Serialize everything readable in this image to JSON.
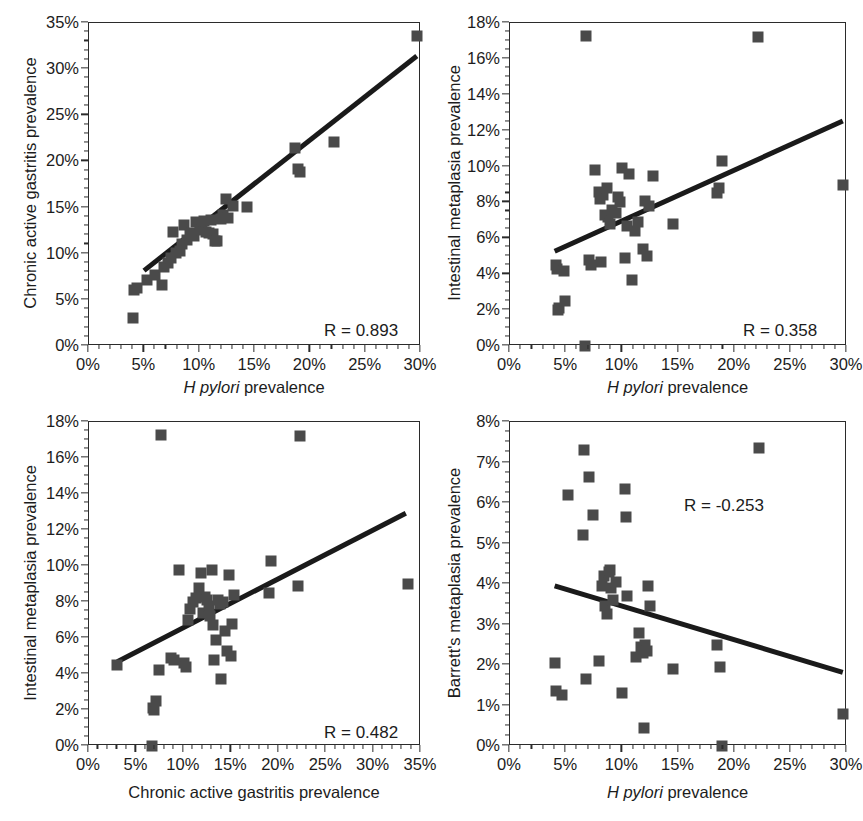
{
  "figure": {
    "panel_count": 4,
    "marker_color": "#4a4a4a",
    "line_color": "#1a1a1a",
    "axis_color": "#2b2b2b",
    "background": "#ffffff",
    "bottom_caption_fragment": ""
  },
  "chart_data": [
    {
      "id": "panel-a",
      "type": "scatter",
      "title": "",
      "xlabel_italic": "H pylori",
      "xlabel_rest": " prevalence",
      "ylabel": "Chronic active gastritis prevalence",
      "annotation": "R = 0.893",
      "r_value": 0.893,
      "xlim": [
        0,
        30
      ],
      "ylim": [
        0,
        35
      ],
      "xticks": [
        0,
        5,
        10,
        15,
        20,
        25,
        30
      ],
      "xticklabels": [
        "0%",
        "5%",
        "10%",
        "15%",
        "20%",
        "25%",
        "30%"
      ],
      "yticks": [
        0,
        5,
        10,
        15,
        20,
        25,
        30,
        35
      ],
      "yticklabels": [
        "0%",
        "5%",
        "10%",
        "15%",
        "20%",
        "25%",
        "30%",
        "35%"
      ],
      "x_minor_step": 1,
      "y_minor_step": 1,
      "grid": false,
      "points": [
        [
          4.0,
          3.0
        ],
        [
          4.1,
          6.1
        ],
        [
          4.3,
          6.3
        ],
        [
          5.2,
          7.1
        ],
        [
          6.0,
          7.7
        ],
        [
          6.6,
          6.6
        ],
        [
          6.8,
          8.6
        ],
        [
          7.1,
          9.0
        ],
        [
          7.4,
          9.5
        ],
        [
          7.6,
          12.4
        ],
        [
          7.9,
          10.1
        ],
        [
          8.2,
          10.3
        ],
        [
          8.4,
          11.0
        ],
        [
          8.6,
          13.1
        ],
        [
          8.9,
          11.5
        ],
        [
          9.1,
          12.0
        ],
        [
          9.3,
          12.2
        ],
        [
          9.5,
          11.9
        ],
        [
          9.7,
          13.4
        ],
        [
          10.0,
          13.2
        ],
        [
          10.2,
          12.6
        ],
        [
          10.4,
          13.5
        ],
        [
          10.6,
          12.4
        ],
        [
          10.8,
          12.2
        ],
        [
          11.0,
          13.6
        ],
        [
          11.2,
          12.1
        ],
        [
          11.4,
          11.4
        ],
        [
          11.6,
          11.4
        ],
        [
          11.9,
          13.8
        ],
        [
          12.1,
          14.2
        ],
        [
          12.4,
          15.9
        ],
        [
          12.6,
          13.9
        ],
        [
          13.0,
          15.2
        ],
        [
          14.3,
          15.1
        ],
        [
          18.6,
          21.5
        ],
        [
          18.9,
          19.2
        ],
        [
          19.1,
          18.9
        ],
        [
          22.1,
          22.1
        ],
        [
          29.6,
          33.6
        ]
      ],
      "fit_line": {
        "x1": 5.0,
        "y1": 8.0,
        "x2": 29.8,
        "y2": 31.4
      }
    },
    {
      "id": "panel-b",
      "type": "scatter",
      "title": "",
      "xlabel_italic": "H pylori",
      "xlabel_rest": " prevalence",
      "ylabel": "Intestinal metaplasia prevalence",
      "annotation": "R = 0.358",
      "r_value": 0.358,
      "xlim": [
        0,
        30
      ],
      "ylim": [
        0,
        18
      ],
      "xticks": [
        0,
        5,
        10,
        15,
        20,
        25,
        30
      ],
      "xticklabels": [
        "0%",
        "5%",
        "10%",
        "15%",
        "20%",
        "25%",
        "30%"
      ],
      "yticks": [
        0,
        2,
        4,
        6,
        8,
        10,
        12,
        14,
        16,
        18
      ],
      "yticklabels": [
        "0%",
        "2%",
        "4%",
        "6%",
        "8%",
        "10%",
        "12%",
        "14%",
        "16%",
        "18%"
      ],
      "x_minor_step": 1,
      "y_minor_step": 0.5,
      "grid": false,
      "points": [
        [
          4.1,
          4.5
        ],
        [
          4.2,
          4.3
        ],
        [
          4.3,
          2.0
        ],
        [
          4.4,
          2.1
        ],
        [
          4.8,
          4.2
        ],
        [
          4.9,
          2.5
        ],
        [
          6.7,
          0.0
        ],
        [
          6.8,
          17.3
        ],
        [
          7.0,
          4.8
        ],
        [
          7.2,
          4.5
        ],
        [
          7.6,
          9.8
        ],
        [
          7.9,
          8.6
        ],
        [
          8.0,
          8.2
        ],
        [
          8.1,
          4.7
        ],
        [
          8.3,
          8.4
        ],
        [
          8.5,
          7.3
        ],
        [
          8.6,
          8.8
        ],
        [
          8.7,
          7.2
        ],
        [
          8.9,
          6.8
        ],
        [
          9.1,
          7.6
        ],
        [
          9.4,
          7.4
        ],
        [
          9.6,
          8.3
        ],
        [
          9.8,
          8.0
        ],
        [
          10.0,
          9.9
        ],
        [
          10.2,
          4.9
        ],
        [
          10.4,
          6.7
        ],
        [
          10.6,
          9.6
        ],
        [
          10.9,
          3.7
        ],
        [
          11.1,
          6.4
        ],
        [
          11.4,
          6.9
        ],
        [
          11.8,
          5.4
        ],
        [
          12.0,
          8.1
        ],
        [
          12.2,
          5.0
        ],
        [
          12.4,
          7.8
        ],
        [
          12.7,
          9.5
        ],
        [
          14.5,
          6.8
        ],
        [
          18.4,
          8.5
        ],
        [
          18.6,
          8.8
        ],
        [
          18.9,
          10.3
        ],
        [
          22.1,
          17.2
        ],
        [
          29.6,
          9.0
        ]
      ],
      "fit_line": {
        "x1": 4.0,
        "y1": 5.2,
        "x2": 29.8,
        "y2": 12.5
      }
    },
    {
      "id": "panel-c",
      "type": "scatter",
      "title": "",
      "xlabel_italic": "",
      "xlabel_rest": "Chronic active gastritis prevalence",
      "ylabel": "Intestinal metaplasia prevalence",
      "annotation": "R = 0.482",
      "r_value": 0.482,
      "xlim": [
        0,
        35
      ],
      "ylim": [
        0,
        18
      ],
      "xticks": [
        0,
        5,
        10,
        15,
        20,
        25,
        30,
        35
      ],
      "xticklabels": [
        "0%",
        "5%",
        "10%",
        "15%",
        "20%",
        "25%",
        "30%",
        "35%"
      ],
      "yticks": [
        0,
        2,
        4,
        6,
        8,
        10,
        12,
        14,
        16,
        18
      ],
      "yticklabels": [
        "0%",
        "2%",
        "4%",
        "6%",
        "8%",
        "10%",
        "12%",
        "14%",
        "16%",
        "18%"
      ],
      "x_minor_step": 1,
      "y_minor_step": 0.5,
      "grid": false,
      "points": [
        [
          3.0,
          4.5
        ],
        [
          6.6,
          0.0
        ],
        [
          6.7,
          2.1
        ],
        [
          6.9,
          2.0
        ],
        [
          7.1,
          2.5
        ],
        [
          7.4,
          4.2
        ],
        [
          7.6,
          17.3
        ],
        [
          8.6,
          4.9
        ],
        [
          9.0,
          4.8
        ],
        [
          9.5,
          9.8
        ],
        [
          10.0,
          4.6
        ],
        [
          10.2,
          4.4
        ],
        [
          10.4,
          7.0
        ],
        [
          10.6,
          7.6
        ],
        [
          11.0,
          8.0
        ],
        [
          11.3,
          8.2
        ],
        [
          11.6,
          8.8
        ],
        [
          11.8,
          9.6
        ],
        [
          12.0,
          7.4
        ],
        [
          12.2,
          8.3
        ],
        [
          12.4,
          8.1
        ],
        [
          12.6,
          7.8
        ],
        [
          12.8,
          7.2
        ],
        [
          13.0,
          9.8
        ],
        [
          13.1,
          6.7
        ],
        [
          13.2,
          4.8
        ],
        [
          13.4,
          5.9
        ],
        [
          13.6,
          8.1
        ],
        [
          13.8,
          7.9
        ],
        [
          13.9,
          3.7
        ],
        [
          14.1,
          8.0
        ],
        [
          14.3,
          6.4
        ],
        [
          14.6,
          5.3
        ],
        [
          14.8,
          9.5
        ],
        [
          15.0,
          5.0
        ],
        [
          15.1,
          6.8
        ],
        [
          15.3,
          8.4
        ],
        [
          19.0,
          8.5
        ],
        [
          19.2,
          10.3
        ],
        [
          22.0,
          8.9
        ],
        [
          22.2,
          17.2
        ],
        [
          33.6,
          9.0
        ]
      ],
      "fit_line": {
        "x1": 3.0,
        "y1": 4.6,
        "x2": 33.6,
        "y2": 12.9
      }
    },
    {
      "id": "panel-d",
      "type": "scatter",
      "title": "",
      "xlabel_italic": "H pylori",
      "xlabel_rest": " prevalence",
      "ylabel": "Barrett's metaplasia prevalence",
      "annotation": "R = -0.253",
      "r_value": -0.253,
      "xlim": [
        0,
        30
      ],
      "ylim": [
        0,
        8
      ],
      "xticks": [
        0,
        5,
        10,
        15,
        20,
        25,
        30
      ],
      "xticklabels": [
        "0%",
        "5%",
        "10%",
        "15%",
        "20%",
        "25%",
        "30%"
      ],
      "yticks": [
        0,
        1,
        2,
        3,
        4,
        5,
        6,
        7,
        8
      ],
      "yticklabels": [
        "0%",
        "1%",
        "2%",
        "3%",
        "4%",
        "5%",
        "6%",
        "7%",
        "8%"
      ],
      "x_minor_step": 1,
      "y_minor_step": 0.25,
      "grid": false,
      "points": [
        [
          4.0,
          2.05
        ],
        [
          4.1,
          1.35
        ],
        [
          4.6,
          1.25
        ],
        [
          5.2,
          6.2
        ],
        [
          6.5,
          5.2
        ],
        [
          6.6,
          7.3
        ],
        [
          6.8,
          1.65
        ],
        [
          7.0,
          6.65
        ],
        [
          7.4,
          5.7
        ],
        [
          7.9,
          2.1
        ],
        [
          8.2,
          3.95
        ],
        [
          8.4,
          4.2
        ],
        [
          8.5,
          3.45
        ],
        [
          8.6,
          3.25
        ],
        [
          8.8,
          4.3
        ],
        [
          8.9,
          4.35
        ],
        [
          9.0,
          3.9
        ],
        [
          9.2,
          3.6
        ],
        [
          9.4,
          4.05
        ],
        [
          10.0,
          1.3
        ],
        [
          10.2,
          6.35
        ],
        [
          10.3,
          5.65
        ],
        [
          10.4,
          3.7
        ],
        [
          11.2,
          2.2
        ],
        [
          11.5,
          2.8
        ],
        [
          11.7,
          2.45
        ],
        [
          11.8,
          2.3
        ],
        [
          11.9,
          0.45
        ],
        [
          12.0,
          2.5
        ],
        [
          12.2,
          2.35
        ],
        [
          12.3,
          3.95
        ],
        [
          12.5,
          3.45
        ],
        [
          14.5,
          1.9
        ],
        [
          18.4,
          2.5
        ],
        [
          18.7,
          1.95
        ],
        [
          18.9,
          0.0
        ],
        [
          22.2,
          7.35
        ],
        [
          29.6,
          0.8
        ]
      ],
      "fit_line": {
        "x1": 4.0,
        "y1": 3.93,
        "x2": 29.8,
        "y2": 1.78
      }
    }
  ]
}
